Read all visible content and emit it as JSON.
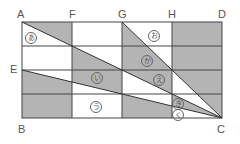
{
  "figure": {
    "colors": {
      "shade": "#b4b4b4",
      "line": "#444444",
      "background": "#ffffff",
      "label": "#555555"
    },
    "vertices": [
      {
        "name": "A",
        "label": "A",
        "x": 17,
        "y": 9
      },
      {
        "name": "F",
        "label": "F",
        "x": 69,
        "y": 9
      },
      {
        "name": "G",
        "label": "G",
        "x": 118,
        "y": 9
      },
      {
        "name": "H",
        "label": "H",
        "x": 168,
        "y": 9
      },
      {
        "name": "D",
        "label": "D",
        "x": 218,
        "y": 9
      },
      {
        "name": "E",
        "label": "E",
        "x": 10,
        "y": 64
      },
      {
        "name": "B",
        "label": "B",
        "x": 18,
        "y": 124
      },
      {
        "name": "C",
        "label": "C",
        "x": 217,
        "y": 124
      }
    ],
    "regions": [
      {
        "id": "a",
        "label": "あ",
        "x": 25,
        "y": 32
      },
      {
        "id": "o",
        "label": "お",
        "x": 148,
        "y": 30
      },
      {
        "id": "ka",
        "label": "か",
        "x": 141,
        "y": 55
      },
      {
        "id": "i",
        "label": "い",
        "x": 91,
        "y": 72
      },
      {
        "id": "e",
        "label": "え",
        "x": 153,
        "y": 74
      },
      {
        "id": "u",
        "label": "う",
        "x": 90,
        "y": 101
      },
      {
        "id": "ki",
        "label": "き",
        "x": 172,
        "y": 98
      },
      {
        "id": "ku",
        "label": "く",
        "x": 172,
        "y": 109
      }
    ]
  }
}
